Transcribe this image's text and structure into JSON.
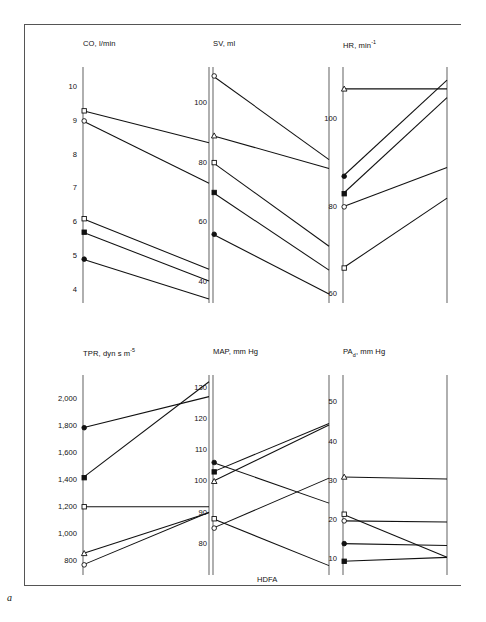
{
  "figure": {
    "letter": "a",
    "group_caption": "HDFA",
    "background": "#ffffff",
    "line_color": "#111111",
    "axis_color": "#6e6e6e"
  },
  "subjects": [
    {
      "id": "s1",
      "marker": "open-circle"
    },
    {
      "id": "s2",
      "marker": "open-square"
    },
    {
      "id": "s3",
      "marker": "filled-circle"
    },
    {
      "id": "s4",
      "marker": "filled-square"
    },
    {
      "id": "s5",
      "marker": "triangle"
    }
  ],
  "chart_data": [
    {
      "type": "line",
      "name": "CO",
      "title": "CO, l/min",
      "variable": "CO",
      "unit": "l/min",
      "xlabel": "",
      "ylabel": "CO, l/min",
      "x": [
        "HD",
        "FA"
      ],
      "ylim": [
        3.6,
        10.6
      ],
      "ticks": [
        10,
        9,
        8,
        7,
        6,
        5,
        4
      ],
      "tick_labels": [
        "10",
        "9",
        "8",
        "7",
        "6",
        "5",
        "4"
      ],
      "grid": false,
      "series": [
        {
          "name": "s2",
          "marker": "open-square",
          "values": [
            9.3,
            8.35
          ]
        },
        {
          "name": "s1",
          "marker": "open-circle",
          "values": [
            9.0,
            7.15
          ]
        },
        {
          "name": "s4",
          "marker": "open-square-low",
          "values": [
            6.1,
            4.6
          ]
        },
        {
          "name": "s3",
          "marker": "filled-square",
          "values": [
            5.7,
            4.25
          ]
        },
        {
          "name": "s5",
          "marker": "filled-circle",
          "values": [
            4.9,
            3.72
          ]
        }
      ]
    },
    {
      "type": "line",
      "name": "SV",
      "title": "SV, ml",
      "variable": "SV",
      "unit": "ml",
      "xlabel": "",
      "ylabel": "SV, ml",
      "x": [
        "HD",
        "FA"
      ],
      "ylim": [
        33,
        112
      ],
      "ticks": [
        100,
        80,
        60,
        40
      ],
      "tick_labels": [
        "100",
        "80",
        "60",
        "40"
      ],
      "grid": false,
      "series": [
        {
          "name": "s1",
          "marker": "open-circle",
          "values": [
            109,
            81
          ]
        },
        {
          "name": "s5",
          "marker": "triangle",
          "values": [
            89,
            78
          ]
        },
        {
          "name": "s2",
          "marker": "open-square",
          "values": [
            80,
            52
          ]
        },
        {
          "name": "s4",
          "marker": "filled-square",
          "values": [
            70,
            44
          ]
        },
        {
          "name": "s3",
          "marker": "filled-circle",
          "values": [
            56,
            36
          ]
        }
      ]
    },
    {
      "type": "line",
      "name": "HR",
      "title": "HR, min-1",
      "variable": "HR",
      "unit": "min⁻¹",
      "xlabel": "",
      "ylabel": "HR, min-1",
      "x": [
        "HD",
        "FA"
      ],
      "ylim": [
        58,
        112
      ],
      "ticks": [
        100,
        80,
        60
      ],
      "tick_labels": [
        "100",
        "80",
        "60"
      ],
      "grid": false,
      "series": [
        {
          "name": "s5",
          "marker": "triangle",
          "values": [
            107,
            107
          ]
        },
        {
          "name": "s3",
          "marker": "filled-circle",
          "values": [
            87,
            109
          ]
        },
        {
          "name": "s4",
          "marker": "filled-square",
          "values": [
            83,
            105
          ]
        },
        {
          "name": "s1",
          "marker": "open-circle",
          "values": [
            80,
            89
          ]
        },
        {
          "name": "s2",
          "marker": "open-square",
          "values": [
            66,
            82
          ]
        }
      ]
    },
    {
      "type": "line",
      "name": "TPR",
      "title": "TPR, dyn s m-5",
      "variable": "TPR",
      "unit": "dyn s m⁻⁵",
      "xlabel": "",
      "ylabel": "TPR, dyn s m-5",
      "x": [
        "HD",
        "FA"
      ],
      "ylim": [
        700,
        2180
      ],
      "ticks": [
        2000,
        1800,
        1600,
        1400,
        1200,
        1000,
        800
      ],
      "tick_labels": [
        "2,000",
        "1,800",
        "1,600",
        "1,400",
        "1,200",
        "1,000",
        "800"
      ],
      "grid": false,
      "series": [
        {
          "name": "s3",
          "marker": "filled-circle",
          "values": [
            1790,
            2020
          ]
        },
        {
          "name": "s4",
          "marker": "filled-square",
          "values": [
            1420,
            2130
          ]
        },
        {
          "name": "s2",
          "marker": "open-square",
          "values": [
            1205,
            1205
          ]
        },
        {
          "name": "s5",
          "marker": "triangle",
          "values": [
            860,
            1160
          ]
        },
        {
          "name": "s1",
          "marker": "open-circle",
          "values": [
            775,
            1165
          ]
        }
      ]
    },
    {
      "type": "line",
      "name": "MAP",
      "title": "MAP, mm Hg",
      "variable": "MAP",
      "unit": "mm Hg",
      "xlabel": "HDFA",
      "ylabel": "MAP, mm Hg",
      "x": [
        "HD",
        "FA"
      ],
      "ylim": [
        70,
        134
      ],
      "ticks": [
        130,
        120,
        110,
        100,
        90,
        80
      ],
      "tick_labels": [
        "130",
        "120",
        "110",
        "100",
        "90",
        "80"
      ],
      "grid": false,
      "series": [
        {
          "name": "s3",
          "marker": "filled-circle",
          "values": [
            106,
            93
          ]
        },
        {
          "name": "s4",
          "marker": "filled-square",
          "values": [
            103,
            118.5
          ]
        },
        {
          "name": "s5",
          "marker": "triangle",
          "values": [
            100,
            118
          ]
        },
        {
          "name": "s2",
          "marker": "open-square",
          "values": [
            88,
            73
          ]
        },
        {
          "name": "s1",
          "marker": "open-circle",
          "values": [
            85,
            101
          ]
        }
      ]
    },
    {
      "type": "line",
      "name": "PAd",
      "title": "PAd, mm Hg",
      "variable": "PAd",
      "unit": "mm Hg",
      "xlabel": "",
      "ylabel": "PAd, mm Hg",
      "x": [
        "HD",
        "FA"
      ],
      "ylim": [
        6,
        57
      ],
      "ticks": [
        50,
        40,
        30,
        20,
        10
      ],
      "tick_labels": [
        "50",
        "40",
        "30",
        "20",
        "10"
      ],
      "grid": false,
      "series": [
        {
          "name": "s5",
          "marker": "triangle",
          "values": [
            31,
            30.5
          ]
        },
        {
          "name": "s2",
          "marker": "open-square",
          "values": [
            21.5,
            10.5
          ]
        },
        {
          "name": "s1",
          "marker": "open-circle",
          "values": [
            19.8,
            19.5
          ]
        },
        {
          "name": "s3",
          "marker": "filled-circle",
          "values": [
            14,
            13.5
          ]
        },
        {
          "name": "s4",
          "marker": "filled-square",
          "values": [
            9.5,
            10.5
          ]
        }
      ]
    }
  ]
}
